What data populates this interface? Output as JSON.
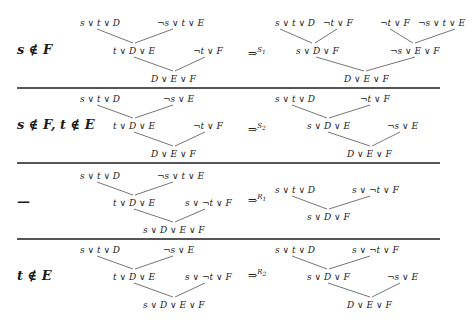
{
  "rows": [
    {
      "condition": "s ∉ F",
      "left_tree": {
        "top_left": "s ∨ t ∨ D",
        "top_right": "¬s ∨ t ∨ E",
        "mid_left": "t ∨ D ∨ E",
        "mid_right": "¬t ∨ F",
        "bottom": "D ∨ E ∨ F"
      },
      "arrow": "⇒",
      "rule": "S",
      "rule_sub": "1",
      "right_tree": {
        "top_1": "s ∨ t ∨ D",
        "top_2": "¬t ∨ F",
        "top_3": "¬t ∨ F",
        "top_4": "¬s ∨ t ∨ E",
        "mid_left": "s ∨ D ∨ F",
        "mid_right": "¬s ∨ E ∨ F",
        "bottom": "D ∨ E ∨ F"
      }
    },
    {
      "condition": "s ∉ F, t ∉ E",
      "left_tree": {
        "top_left": "s ∨ t ∨ D",
        "top_right": "¬s ∨ E",
        "mid_left": "t ∨ D ∨ E",
        "mid_right": "¬t ∨ F",
        "bottom": "D ∨ E ∨ F"
      },
      "arrow": "⇒",
      "rule": "S",
      "rule_sub": "2",
      "right_tree": {
        "top_left": "s ∨ t ∨ D",
        "top_right": "¬t ∨ F",
        "mid_left": "s ∨ D ∨ E",
        "mid_right": "¬s ∨ E",
        "bottom": "D ∨ E ∨ F"
      }
    },
    {
      "condition": "—",
      "left_tree": {
        "top_left": "s ∨ t ∨ D",
        "top_right": "¬s ∨ t ∨ E",
        "mid_left": "t ∨ D ∨ E",
        "mid_right": "s ∨ ¬t ∨ F",
        "bottom": "s ∨ D ∨ E ∨ F"
      },
      "arrow": "⇒",
      "rule": "R",
      "rule_sub": "1",
      "right_tree": {
        "top_left": "s ∨ t ∨ D",
        "top_right": "s ∨ ¬t ∨ F",
        "bottom": "s ∨ D ∨ F"
      }
    },
    {
      "condition": "t ∉ E",
      "left_tree": {
        "top_left": "s ∨ t ∨ D",
        "top_right": "¬s ∨ E",
        "mid_left": "t ∨ D ∨ E",
        "mid_right": "s ∨ ¬t ∨ F",
        "bottom": "s ∨ D ∨ E ∨ F"
      },
      "arrow": "⇒",
      "rule": "R",
      "rule_sub": "2",
      "right_tree": {
        "top_left": "s ∨ t ∨ D",
        "top_right": "s ∨ ¬t ∨ F",
        "mid_left": "s ∨ D ∨ F",
        "mid_right": "¬s ∨ E",
        "bottom": "D ∨ E ∨ F"
      }
    }
  ]
}
